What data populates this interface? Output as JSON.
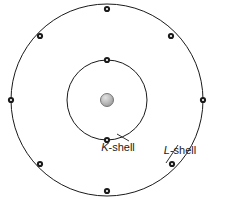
{
  "figure": {
    "name": "bohr-atom-shell-diagram",
    "width": 229,
    "height": 202,
    "background_color": "#ffffff"
  },
  "nucleus": {
    "label": "nucleus",
    "cx": 107,
    "cy": 100,
    "r": 6.5,
    "fill_center_color": "#d8d8d8",
    "fill_edge_color": "#8e8e8e",
    "stroke_color": "#6b6b6b"
  },
  "shells": [
    {
      "id": "k-shell",
      "letter": "K",
      "suffix": "-shell",
      "cx": 107,
      "cy": 100,
      "r": 40,
      "stroke_color": "#1a1a1a",
      "stroke_width": 1,
      "electron_count": 2,
      "label_x": 118,
      "label_y": 151,
      "electrons": [
        {
          "cx": 107,
          "cy": 60
        },
        {
          "cx": 107,
          "cy": 140
        }
      ]
    },
    {
      "id": "l-shell",
      "letter": "L",
      "suffix": "-shell",
      "cx": 107,
      "cy": 100,
      "r": 96,
      "stroke_color": "#1a1a1a",
      "stroke_width": 1,
      "electron_count": 8,
      "label_x": 180,
      "label_y": 154,
      "electrons": [
        {
          "cx": 107,
          "cy": 9
        },
        {
          "cx": 171,
          "cy": 36
        },
        {
          "cx": 203,
          "cy": 100
        },
        {
          "cx": 172,
          "cy": 164
        },
        {
          "cx": 107,
          "cy": 191
        },
        {
          "cx": 40,
          "cy": 164
        },
        {
          "cx": 11,
          "cy": 100
        },
        {
          "cx": 40,
          "cy": 36
        }
      ]
    }
  ],
  "electron_style": {
    "r_outer": 3.1,
    "r_inner": 1.1,
    "outer_color": "#1a1a1a",
    "inner_color": "#ffffff"
  },
  "leader_lines": [
    {
      "id": "k-shell-leader",
      "x1": 129,
      "y1": 141,
      "x2": 117,
      "y2": 134
    },
    {
      "id": "l-shell-leader",
      "x1": 178,
      "y1": 145,
      "x2": 166,
      "y2": 163
    }
  ]
}
